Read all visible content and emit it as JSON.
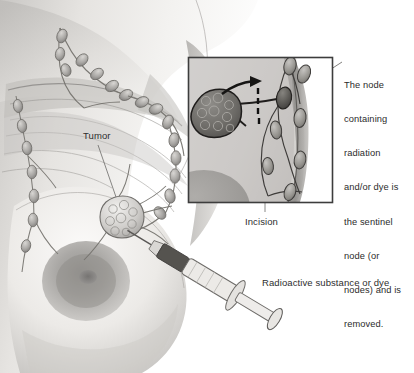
{
  "illustration": {
    "title": "Sentinel lymph node biopsy of the breast",
    "style": "grayscale medical line-and-wash illustration",
    "background_color": "#ffffff",
    "ink_color": "#3a3a3a",
    "skin_light": "#f2f1ef",
    "skin_mid": "#cfcdcb",
    "skin_dark": "#9a9896",
    "tumor_color": "#b9b7b4",
    "sentinel_node_color": "#5a5856"
  },
  "labels": {
    "tumor": "Tumor",
    "incision": "Incision",
    "radioactive": "Radioactive substance or dye"
  },
  "callout": {
    "lines": [
      "The node",
      "containing",
      "radiation",
      "and/or dye is",
      "the sentinel",
      "node (or",
      "nodes) and is",
      "removed."
    ],
    "text": "The node containing radiation and/or dye is the sentinel node (or nodes) and is removed."
  },
  "inset": {
    "name": "axilla-detail-inset",
    "border_color": "#3d3d3d",
    "x": 188,
    "y": 57,
    "width": 145,
    "height": 146,
    "contents": [
      "tumor-mass",
      "lymph-vessel",
      "arrow-of-flow",
      "dashed-incision-line",
      "sentinel-node",
      "lymph-node-chain"
    ]
  },
  "parts": {
    "breast": "breast",
    "nipple": "nipple-areola",
    "lymph_chain": "lymph-node-chain",
    "tumor_mass": "tumor-mass",
    "syringe": "syringe",
    "needle": "needle",
    "plunger": "plunger",
    "arrow": "flow-arrow",
    "dashed_line": "dashed-incision-line",
    "sentinel_node": "sentinel-node"
  }
}
